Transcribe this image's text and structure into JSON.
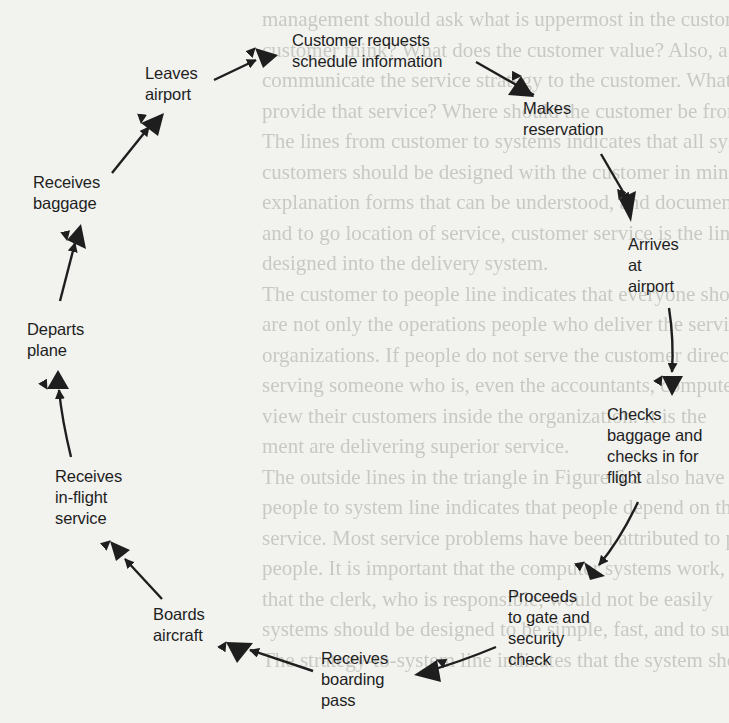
{
  "diagram": {
    "type": "cycle",
    "nodes": [
      {
        "id": "n1",
        "lines": [
          "Customer requests",
          "schedule information"
        ],
        "x": 292,
        "y": 30
      },
      {
        "id": "n2",
        "lines": [
          "Makes",
          "reservation"
        ],
        "x": 523,
        "y": 97
      },
      {
        "id": "n3",
        "lines": [
          "Arrives",
          "at",
          "airport"
        ],
        "x": 628,
        "y": 233
      },
      {
        "id": "n4",
        "lines": [
          "Checks",
          "baggage and",
          "checks in for",
          "flight"
        ],
        "x": 607,
        "y": 404
      },
      {
        "id": "n5",
        "lines": [
          "Proceeds",
          "to gate and",
          "security",
          "check"
        ],
        "x": 508,
        "y": 586
      },
      {
        "id": "n6",
        "lines": [
          "Receives",
          "boarding",
          "pass"
        ],
        "x": 321,
        "y": 648
      },
      {
        "id": "n7",
        "lines": [
          "Boards",
          "aircraft"
        ],
        "x": 153,
        "y": 604
      },
      {
        "id": "n8",
        "lines": [
          "Receives",
          "in-flight",
          "service"
        ],
        "x": 55,
        "y": 466
      },
      {
        "id": "n9",
        "lines": [
          "Departs",
          "plane"
        ],
        "x": 27,
        "y": 319
      },
      {
        "id": "n10",
        "lines": [
          "Receives",
          "baggage"
        ],
        "x": 33,
        "y": 172
      },
      {
        "id": "n11",
        "lines": [
          "Leaves",
          "airport"
        ],
        "x": 145,
        "y": 63
      }
    ],
    "edges": [
      {
        "from": "n1",
        "to": "n2"
      },
      {
        "from": "n2",
        "to": "n3"
      },
      {
        "from": "n3",
        "to": "n4"
      },
      {
        "from": "n4",
        "to": "n5"
      },
      {
        "from": "n5",
        "to": "n6"
      },
      {
        "from": "n6",
        "to": "n7"
      },
      {
        "from": "n7",
        "to": "n8"
      },
      {
        "from": "n8",
        "to": "n9"
      },
      {
        "from": "n9",
        "to": "n10"
      },
      {
        "from": "n10",
        "to": "n11"
      },
      {
        "from": "n11",
        "to": "n1"
      }
    ],
    "colors": {
      "ink": "#1e1e1e",
      "paper": "#f2f2ef",
      "bleed_through": "#c9c9c4"
    }
  },
  "background_bleed_text": [
    "management should ask what is uppermost in the customer's mind",
    "customer think? What does the customer value? Also, a",
    "communicate the service strategy to the customer. What does",
    "provide that service? Where should the customer be from this c",
    "The lines from customer to systems indicates that all systems",
    "customers should be designed with the customer in mind, includ",
    "explanation forms that can be understood, and documents easily",
    "and to go location of service, customer service is the line within",
    "designed into the delivery system.",
    "The customer to people line indicates that everyone should",
    "are not only the operations people who deliver the service but",
    "organizations. If people do not serve the customer directly, th",
    "serving someone who is, even the accountants, computer people",
    "view their customers inside the organization. It is the",
    "ment are delivering superior service.",
    "The outside lines in the triangle in Figure 6.2 also have significance",
    "people to system line indicates that people depend on the system to",
    "service. Most service problems have been attributed to poor systems",
    "people. It is important that the computer systems work, if the c",
    "that the clerk, who is responsible, would not be easily",
    "systems should be designed to be simple, fast, and to support",
    "The strategy-to-system line indicates that the system should"
  ]
}
